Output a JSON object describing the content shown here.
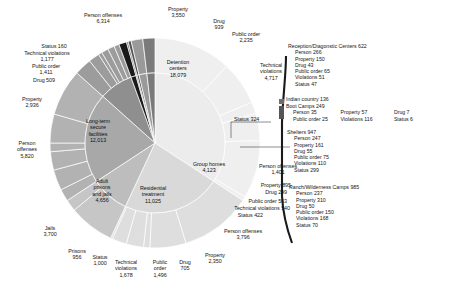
{
  "chart_data": {
    "type": "pie",
    "title": "",
    "subtitle": "",
    "layout": {
      "rings": 2,
      "center": [
        155,
        143
      ],
      "inner_radius": 70,
      "outer_radius": 105,
      "start_angle_deg": -90,
      "direction": "clockwise",
      "grid": false,
      "legend_position": "none",
      "callout_panel": "right"
    },
    "inner_ring": [
      {
        "label": "Detention centers",
        "value": 18079,
        "color": "#ececec"
      },
      {
        "label": "Long-term secure facilities",
        "value": 12013,
        "color": "#d9d9d9"
      },
      {
        "label": "Adult prisons and jails",
        "value": 4656,
        "color": "#bdbdbd"
      },
      {
        "label": "Residential treatment",
        "value": 11025,
        "color": "#a8a8a8"
      },
      {
        "label": "Group homes",
        "value": 4123,
        "color": "#8f8f8f"
      },
      {
        "label": "Reception/Diagonstic Centers",
        "value": 622,
        "color": "#1a1a1a"
      },
      {
        "label": "Indian country",
        "value": 136,
        "color": "#6e6e6e"
      },
      {
        "label": "Boot Camps",
        "value": 249,
        "color": "#555555"
      },
      {
        "label": "Shelters",
        "value": 947,
        "color": "#9a9a9a"
      },
      {
        "label": "Ranch/Wilderness Camps",
        "value": 985,
        "color": "#7a7a7a"
      }
    ],
    "outer_ring": [
      {
        "parent": "Detention centers",
        "label": "Person offenses",
        "value": 6314,
        "color": "#efefef"
      },
      {
        "parent": "Detention centers",
        "label": "Property",
        "value": 3550,
        "color": "#efefef"
      },
      {
        "parent": "Detention centers",
        "label": "Drug",
        "value": 939,
        "color": "#efefef"
      },
      {
        "parent": "Detention centers",
        "label": "Public order",
        "value": 2235,
        "color": "#efefef"
      },
      {
        "parent": "Detention centers",
        "label": "Technical violations",
        "value": 4717,
        "color": "#efefef"
      },
      {
        "parent": "Detention centers",
        "label": "Status",
        "value": 324,
        "color": "#efefef"
      },
      {
        "parent": "Long-term secure facilities",
        "label": "Person offenses",
        "value": 5820,
        "color": "#dedede"
      },
      {
        "parent": "Long-term secure facilities",
        "label": "Property",
        "value": 2936,
        "color": "#dedede"
      },
      {
        "parent": "Long-term secure facilities",
        "label": "Drug",
        "value": 509,
        "color": "#dedede"
      },
      {
        "parent": "Long-term secure facilities",
        "label": "Public order",
        "value": 1411,
        "color": "#dedede"
      },
      {
        "parent": "Long-term secure facilities",
        "label": "Technical violations",
        "value": 1177,
        "color": "#dedede"
      },
      {
        "parent": "Long-term secure facilities",
        "label": "Status",
        "value": 160,
        "color": "#dedede"
      },
      {
        "parent": "Adult prisons and jails",
        "label": "Jails",
        "value": 3700,
        "color": "#c6c6c6"
      },
      {
        "parent": "Adult prisons and jails",
        "label": "Prisons",
        "value": 956,
        "color": "#c6c6c6"
      },
      {
        "parent": "Residential treatment",
        "label": "Status",
        "value": 1000,
        "color": "#b2b2b2"
      },
      {
        "parent": "Residential treatment",
        "label": "Technical violations",
        "value": 1678,
        "color": "#b2b2b2"
      },
      {
        "parent": "Residential treatment",
        "label": "Public order",
        "value": 1496,
        "color": "#b2b2b2"
      },
      {
        "parent": "Residential treatment",
        "label": "Drug",
        "value": 705,
        "color": "#b2b2b2"
      },
      {
        "parent": "Residential treatment",
        "label": "Property",
        "value": 2350,
        "color": "#b2b2b2"
      },
      {
        "parent": "Residential treatment",
        "label": "Person offenses",
        "value": 3796,
        "color": "#b2b2b2"
      },
      {
        "parent": "Group homes",
        "label": "Person offenses",
        "value": 1401,
        "color": "#9c9c9c"
      },
      {
        "parent": "Group homes",
        "label": "Property",
        "value": 895,
        "color": "#9c9c9c"
      },
      {
        "parent": "Group homes",
        "label": "Drug",
        "value": 299,
        "color": "#9c9c9c"
      },
      {
        "parent": "Group homes",
        "label": "Public order",
        "value": 563,
        "color": "#9c9c9c"
      },
      {
        "parent": "Group homes",
        "label": "Technical violations",
        "value": 540,
        "color": "#9c9c9c"
      },
      {
        "parent": "Group homes",
        "label": "Status",
        "value": 422,
        "color": "#9c9c9c"
      }
    ]
  },
  "inner_labels": {
    "detention": {
      "name": "Detention",
      "name2": "centers",
      "value": "18,079"
    },
    "longterm": {
      "name": "Long-term",
      "name2": "secure",
      "name3": "facilities",
      "value": "12,013"
    },
    "adult": {
      "name": "Adult",
      "name2": "prisons",
      "name3": "and jails",
      "value": "4,656"
    },
    "residential": {
      "name": "Residential",
      "name2": "treatment",
      "value": "11,025"
    },
    "grouphomes": {
      "name": "Group homes",
      "value": "4,123"
    }
  },
  "outer_labels": {
    "det_person": {
      "name": "Person offenses",
      "value": "6,314"
    },
    "det_property": {
      "name": "Property",
      "value": "3,550"
    },
    "det_drug": {
      "name": "Drug",
      "value": "939"
    },
    "det_public": {
      "name": "Public order",
      "value": "2,235"
    },
    "det_tech": {
      "name": "Technical",
      "name2": "violations",
      "value": "4,717"
    },
    "det_status": {
      "text": "Status 324"
    },
    "lt_status": {
      "text": "Status 160"
    },
    "lt_tech": {
      "name": "Technical violations",
      "value": "1,177"
    },
    "lt_public": {
      "name": "Public order",
      "value": "1,411"
    },
    "lt_drug": {
      "text": "Drug 509"
    },
    "lt_property": {
      "name": "Property",
      "value": "2,936"
    },
    "lt_person": {
      "name": "Person",
      "name2": "offenses",
      "value": "5,820"
    },
    "jails": {
      "name": "Jails",
      "value": "3,700"
    },
    "prisons": {
      "name": "Prisons",
      "value": "956"
    },
    "rt_status": {
      "name": "Status",
      "value": "1,000"
    },
    "rt_tech": {
      "name": "Technical",
      "name2": "violations",
      "value": "1,678"
    },
    "rt_public": {
      "name": "Public",
      "name2": "order",
      "value": "1,496"
    },
    "rt_drug": {
      "name": "Drug",
      "value": "705"
    },
    "rt_property": {
      "name": "Property",
      "value": "2,350"
    },
    "rt_person": {
      "name": "Person offenses",
      "value": "3,796"
    },
    "gh_person": {
      "name": "Person offenses",
      "value": "1,401"
    },
    "gh_property": {
      "text": "Property 895"
    },
    "gh_drug": {
      "text": "Drug 299"
    },
    "gh_public": {
      "text": "Public order 563"
    },
    "gh_tech": {
      "text": "Technical violations 540"
    },
    "gh_status": {
      "text": "Status 422"
    }
  },
  "callouts": {
    "reception": {
      "header": "Reception/Diagonstic Centers 622",
      "items": [
        "Person 266",
        "Property 150",
        "Drug 43",
        "Public order 65",
        "Violations 51",
        "Status 47"
      ]
    },
    "indian": {
      "header": "Indian country 136",
      "items": []
    },
    "bootcamps": {
      "header": "Boot Camps 249",
      "row1": [
        "Person 35",
        "Property 57",
        "Drug 7"
      ],
      "row2": [
        "Public order 25",
        "Violations 116",
        "Status 6"
      ]
    },
    "shelters": {
      "header": "Shelters 947",
      "items": [
        "Person 247",
        "Property 161",
        "Drug 55",
        "Public order 75",
        "Violations 110",
        "Status 299"
      ]
    },
    "ranch": {
      "header": "Ranch/Wilderness Camps 985",
      "items": [
        "Person 237",
        "Property 310",
        "Drug 50",
        "Public order 150",
        "Violations 168",
        "Status 70"
      ]
    }
  }
}
